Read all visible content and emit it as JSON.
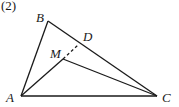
{
  "figure": {
    "caption": "(2)",
    "points": {
      "A": {
        "label": "A",
        "x": 21,
        "y": 96
      },
      "B": {
        "label": "B",
        "x": 48,
        "y": 21
      },
      "C": {
        "label": "C",
        "x": 157,
        "y": 96
      },
      "D": {
        "label": "D",
        "x": 78,
        "y": 45
      },
      "M": {
        "label": "M",
        "x": 63,
        "y": 59
      }
    },
    "segments": [
      {
        "from": "A",
        "to": "B",
        "style": "solid"
      },
      {
        "from": "B",
        "to": "C",
        "style": "solid"
      },
      {
        "from": "A",
        "to": "C",
        "style": "solid"
      },
      {
        "from": "A",
        "to": "M",
        "style": "solid"
      },
      {
        "from": "M",
        "to": "C",
        "style": "solid"
      },
      {
        "from": "M",
        "to": "D",
        "style": "dashed"
      }
    ],
    "colors": {
      "line": "#1a1a1a",
      "background": "#ffffff"
    }
  }
}
